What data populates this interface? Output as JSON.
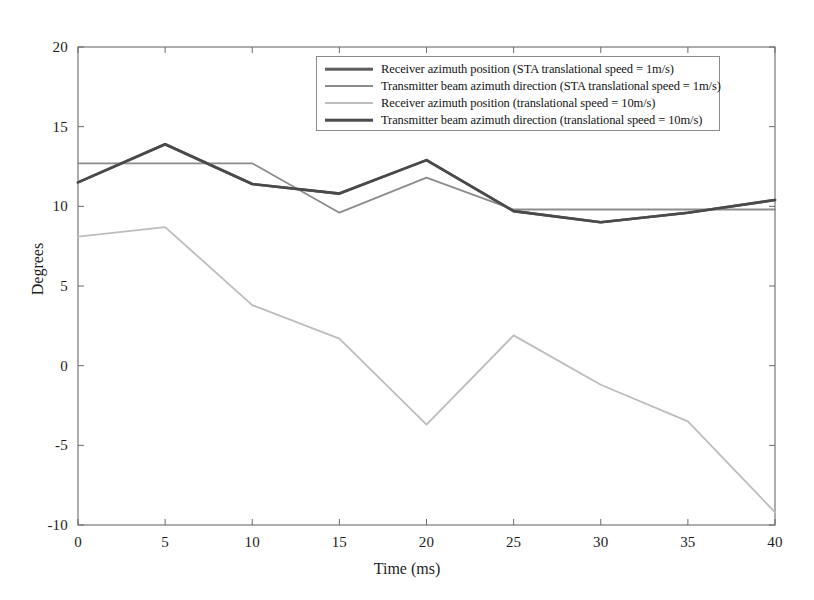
{
  "chart_data": {
    "type": "line",
    "title": "",
    "xlabel": "Time (ms)",
    "ylabel": "Degrees",
    "xlim": [
      0,
      40
    ],
    "ylim": [
      -10,
      20
    ],
    "xticks": [
      0,
      5,
      10,
      15,
      20,
      25,
      30,
      35,
      40
    ],
    "yticks": [
      20,
      15,
      10,
      5,
      0,
      -5,
      -10
    ],
    "xtick_labels": [
      "0",
      "5",
      "10",
      "15",
      "20",
      "25",
      "30",
      "35",
      "40"
    ],
    "ytick_labels": [
      "20",
      "15",
      "10",
      "5",
      "0",
      "-5",
      "-10"
    ],
    "grid": false,
    "legend_position": "top-center",
    "x": [
      0,
      5,
      10,
      15,
      20,
      25,
      30,
      35,
      40
    ],
    "series": [
      {
        "name": "Receiver azimuth position (STA translational speed = 1m/s)",
        "color": "#5d5d5d",
        "width": 2.6,
        "values": [
          11.5,
          13.9,
          11.4,
          10.8,
          12.9,
          9.7,
          9.0,
          9.6,
          10.4
        ]
      },
      {
        "name": "Transmitter beam azimuth direction (STA translational speed = 1m/s)",
        "color": "#8c8c8c",
        "width": 1.8,
        "values": [
          12.7,
          12.7,
          12.7,
          9.6,
          11.8,
          9.8,
          9.8,
          9.8,
          9.8
        ]
      },
      {
        "name": "Receiver azimuth position (translational speed = 10m/s)",
        "color": "#bdbdbd",
        "width": 1.8,
        "values": [
          8.1,
          8.7,
          3.8,
          1.7,
          -3.7,
          1.9,
          -1.2,
          -3.5,
          -9.2
        ]
      },
      {
        "name": "Transmitter beam azimuth direction (translational speed = 10m/s)",
        "color": "#4a4a4a",
        "width": 2.6,
        "values": [
          11.5,
          13.9,
          11.4,
          10.8,
          12.9,
          9.7,
          9.0,
          9.6,
          10.4
        ]
      }
    ]
  },
  "legend": {
    "entries": [
      "Receiver azimuth position (STA translational speed = 1m/s)",
      "Transmitter beam azimuth direction (STA translational speed = 1m/s)",
      "Receiver azimuth position (translational speed = 10m/s)",
      "Transmitter beam azimuth direction (translational speed = 10m/s)"
    ]
  },
  "axes": {
    "frame_color": "#6b6b6b"
  }
}
